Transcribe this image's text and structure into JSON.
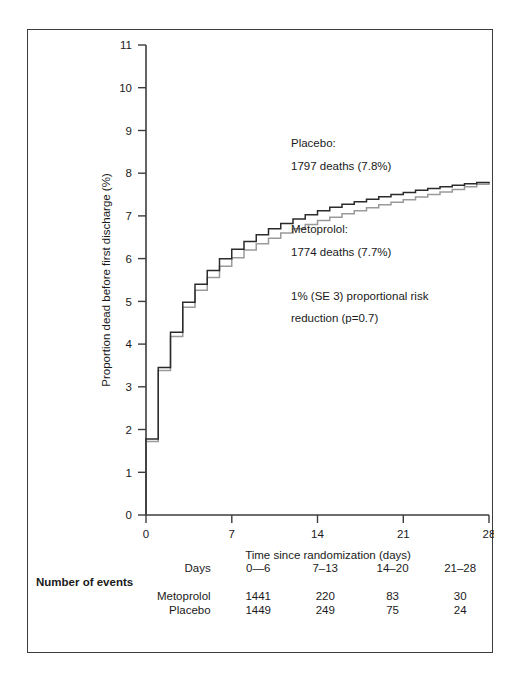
{
  "chart_data": {
    "type": "line",
    "subtype": "kaplan-meier-step",
    "title": "",
    "xlabel": "Time since randomization (days)",
    "ylabel": "Proportion dead before first discharge (%)",
    "xlim": [
      0,
      28
    ],
    "ylim": [
      0,
      11
    ],
    "xticks": [
      0,
      7,
      14,
      21,
      28
    ],
    "yticks": [
      0,
      1,
      2,
      3,
      4,
      5,
      6,
      7,
      8,
      9,
      10,
      11
    ],
    "xtick_labels": [
      "0",
      "7",
      "14",
      "21",
      "28"
    ],
    "ytick_labels": [
      "0",
      "1",
      "2",
      "3",
      "4",
      "5",
      "6",
      "7",
      "8",
      "9",
      "10",
      "11"
    ],
    "grid": false,
    "legend_position": "inline-annotation",
    "x": [
      0,
      1,
      2,
      3,
      4,
      5,
      6,
      7,
      8,
      9,
      10,
      11,
      12,
      13,
      14,
      15,
      16,
      17,
      18,
      19,
      20,
      21,
      22,
      23,
      24,
      25,
      26,
      27,
      28
    ],
    "series": [
      {
        "name": "Placebo",
        "color": "#2b2b2b",
        "values": [
          1.78,
          3.45,
          4.28,
          4.98,
          5.4,
          5.72,
          6.0,
          6.22,
          6.4,
          6.56,
          6.7,
          6.82,
          6.93,
          7.03,
          7.12,
          7.2,
          7.27,
          7.33,
          7.39,
          7.45,
          7.5,
          7.55,
          7.6,
          7.64,
          7.68,
          7.72,
          7.75,
          7.78,
          7.8
        ]
      },
      {
        "name": "Metoprolol",
        "color": "#9a9a9a",
        "values": [
          1.72,
          3.38,
          4.18,
          4.86,
          5.26,
          5.56,
          5.82,
          6.02,
          6.2,
          6.35,
          6.48,
          6.6,
          6.7,
          6.8,
          6.89,
          6.97,
          7.05,
          7.12,
          7.19,
          7.26,
          7.32,
          7.38,
          7.44,
          7.5,
          7.56,
          7.62,
          7.68,
          7.74,
          7.79
        ]
      }
    ]
  },
  "annotations": {
    "placebo_heading": "Placebo:",
    "placebo_detail": "1797 deaths (7.8%)",
    "metoprolol_heading": "Metoprolol:",
    "metoprolol_detail": "1774 deaths (7.7%)",
    "risk_line1": "1% (SE 3) proportional risk",
    "risk_line2": "reduction (p=0.7)"
  },
  "axes": {
    "y_title": "Proportion dead before first discharge (%)",
    "x_title": "Time since randomization (days)",
    "x_ticks": [
      "0",
      "7",
      "14",
      "21",
      "28"
    ],
    "y_ticks": [
      "11",
      "10",
      "9",
      "8",
      "7",
      "6",
      "5",
      "4",
      "3",
      "2",
      "1",
      "0"
    ]
  },
  "events_table": {
    "days_label": "Days",
    "day_ranges": [
      "0—6",
      "7–13",
      "14–20",
      "21–28"
    ],
    "section_label": "Number of events",
    "rows": [
      {
        "label": "Metoprolol",
        "values": [
          "1441",
          "220",
          "83",
          "30"
        ]
      },
      {
        "label": "Placebo",
        "values": [
          "1449",
          "249",
          "75",
          "24"
        ]
      }
    ]
  },
  "colors": {
    "placebo_line": "#2b2b2b",
    "metoprolol_line": "#9a9a9a",
    "axis": "#3c3c3c",
    "frame": "#3c3c3c",
    "text": "#1a1a1a"
  }
}
